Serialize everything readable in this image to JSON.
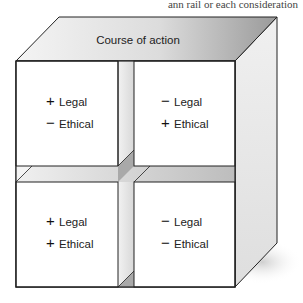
{
  "header_fragment": "ann rail or each consideration",
  "diagram": {
    "title": "Course of action",
    "quadrants": [
      {
        "position": "top-left",
        "legal_sign": "+",
        "legal_label": "Legal",
        "ethical_sign": "−",
        "ethical_label": "Ethical"
      },
      {
        "position": "top-right",
        "legal_sign": "−",
        "legal_label": "Legal",
        "ethical_sign": "+",
        "ethical_label": "Ethical"
      },
      {
        "position": "bottom-left",
        "legal_sign": "+",
        "legal_label": "Legal",
        "ethical_sign": "+",
        "ethical_label": "Ethical"
      },
      {
        "position": "bottom-right",
        "legal_sign": "−",
        "legal_label": "Legal",
        "ethical_sign": "−",
        "ethical_label": "Ethical"
      }
    ]
  },
  "colors": {
    "outline": "#222222",
    "face_light": "#ffffff",
    "top_gradient_start": "#f2f2f2",
    "top_gradient_end": "#9a9a9a",
    "side_light": "#f4f4f4",
    "side_dark": "#cfcfcf",
    "gap_fill": "#e6e6e6",
    "gap_dark": "#a8a8a8"
  }
}
